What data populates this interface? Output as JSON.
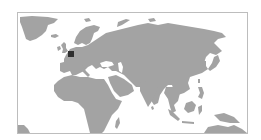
{
  "map": {
    "type": "locator-map",
    "region_shown": "Europe, Africa and Asia (Eastern Hemisphere)",
    "colors": {
      "background": "#ffffff",
      "frame": "#bdbdbd",
      "land": "#a3a3a3",
      "marker": "#2e2e2e"
    },
    "marker": {
      "shape": "square",
      "approx_location": "Western Europe (Benelux region)",
      "x": 50,
      "y": 38,
      "size": 6
    },
    "labels": []
  }
}
